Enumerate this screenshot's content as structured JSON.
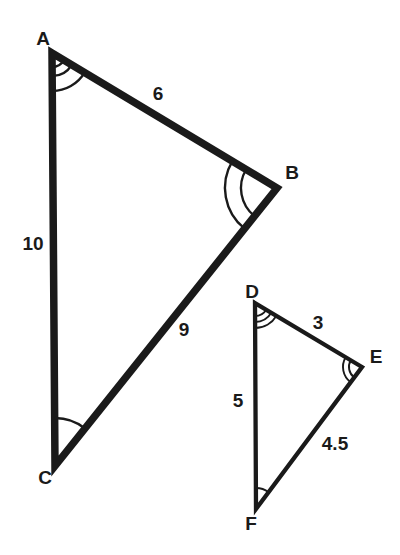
{
  "figure": {
    "type": "similar-triangles-diagram",
    "background_color": "#ffffff",
    "line_color": "#1a1a1a",
    "labels": {
      "A": "A",
      "B": "B",
      "C": "C",
      "D": "D",
      "E": "E",
      "F": "F",
      "AB": "6",
      "AC": "10",
      "CB": "9",
      "DE": "3",
      "DF": "5",
      "FE": "4.5"
    },
    "triangles": [
      {
        "name": "triangle ABC",
        "vertices": [
          "A",
          "B",
          "C"
        ],
        "side_lengths": {
          "AB": "6",
          "AC": "10",
          "CB": "9"
        },
        "angle_arc_counts": {
          "A": 3,
          "B": 2,
          "C": 1
        }
      },
      {
        "name": "triangle DEF",
        "vertices": [
          "D",
          "E",
          "F"
        ],
        "side_lengths": {
          "DE": "3",
          "DF": "5",
          "FE": "4.5"
        },
        "angle_arc_counts": {
          "D": 3,
          "E": 2,
          "F": 1
        }
      }
    ]
  }
}
